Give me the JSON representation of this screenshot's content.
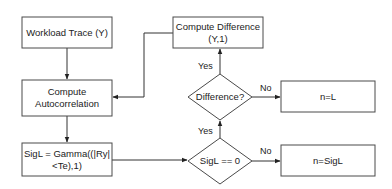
{
  "diagram": {
    "type": "flowchart",
    "nodes": {
      "workload_trace": {
        "shape": "rect",
        "lines": [
          "Workload Trace (Y)"
        ]
      },
      "compute_autocorrelation": {
        "shape": "rect",
        "lines": [
          "Compute",
          "Autocorrelation"
        ]
      },
      "sigl_gamma": {
        "shape": "rect",
        "lines": [
          "SigL = Gamma((|Ry|",
          "<Te),1)"
        ]
      },
      "compute_difference": {
        "shape": "rect",
        "lines": [
          "Compute Difference",
          "(Y,1)"
        ]
      },
      "difference_decision": {
        "shape": "diamond",
        "lines": [
          "Difference?"
        ]
      },
      "sigl_zero_decision": {
        "shape": "diamond",
        "lines": [
          "SigL == 0"
        ]
      },
      "n_equals_l": {
        "shape": "rect",
        "lines": [
          "n=L"
        ]
      },
      "n_equals_sigl": {
        "shape": "rect",
        "lines": [
          "n=SigL"
        ]
      }
    },
    "edges": [
      {
        "from": "workload_trace",
        "to": "compute_autocorrelation",
        "label": ""
      },
      {
        "from": "compute_autocorrelation",
        "to": "sigl_gamma",
        "label": ""
      },
      {
        "from": "sigl_gamma",
        "to": "sigl_zero_decision",
        "label": ""
      },
      {
        "from": "sigl_zero_decision",
        "to": "difference_decision",
        "label": "Yes"
      },
      {
        "from": "sigl_zero_decision",
        "to": "n_equals_sigl",
        "label": "No"
      },
      {
        "from": "difference_decision",
        "to": "compute_difference",
        "label": "Yes"
      },
      {
        "from": "difference_decision",
        "to": "n_equals_l",
        "label": "No"
      },
      {
        "from": "compute_difference",
        "to": "compute_autocorrelation",
        "label": ""
      }
    ],
    "edge_labels": {
      "sigl_to_difference": "Yes",
      "sigl_to_nsigl": "No",
      "difference_to_compute_difference": "Yes",
      "difference_to_nl": "No"
    }
  }
}
